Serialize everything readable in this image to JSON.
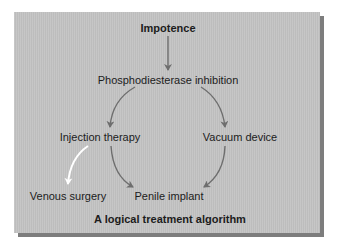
{
  "diagram": {
    "title": "Impotence",
    "caption": "A logical treatment algorithm",
    "nodes": {
      "root": "Impotence",
      "first_line": "Phosphodiesterase inhibition",
      "left_branch": "Injection therapy",
      "right_branch": "Vacuum device",
      "left_outcome": "Venous surgery",
      "final": "Penile implant"
    },
    "edges": [
      {
        "from": "Impotence",
        "to": "Phosphodiesterase inhibition",
        "color": "#6e6e6e"
      },
      {
        "from": "Phosphodiesterase inhibition",
        "to": "Injection therapy",
        "color": "#6e6e6e"
      },
      {
        "from": "Phosphodiesterase inhibition",
        "to": "Vacuum device",
        "color": "#6e6e6e"
      },
      {
        "from": "Injection therapy",
        "to": "Penile implant",
        "color": "#6e6e6e"
      },
      {
        "from": "Vacuum device",
        "to": "Penile implant",
        "color": "#6e6e6e"
      },
      {
        "from": "Injection therapy",
        "to": "Venous surgery",
        "color": "#ffffff"
      }
    ],
    "colors": {
      "panel": "#c3c3c3",
      "shadow": "#7d7d7d",
      "arrow": "#6e6e6e",
      "highlight_arrow": "#ffffff",
      "text": "#1c1c1c"
    }
  }
}
